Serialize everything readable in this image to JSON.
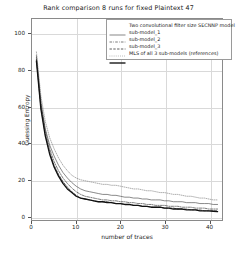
{
  "chart_data": {
    "type": "line",
    "title": "Rank comparison 8 runs for fixed Plaintext 47",
    "xlabel": "number of traces",
    "ylabel": "Guessing Entropy",
    "xlim": [
      0,
      43
    ],
    "ylim": [
      -2,
      108
    ],
    "xticks": [
      0,
      10,
      20,
      30,
      40
    ],
    "yticks": [
      0,
      20,
      40,
      60,
      80,
      100
    ],
    "grid": true,
    "legend_position": "upper right",
    "x": [
      1,
      2,
      3,
      4,
      5,
      6,
      7,
      8,
      9,
      10,
      11,
      12,
      13,
      14,
      15,
      16,
      17,
      18,
      19,
      20,
      21,
      22,
      23,
      24,
      25,
      26,
      27,
      28,
      29,
      30,
      31,
      32,
      33,
      34,
      35,
      36,
      37,
      38,
      39,
      40,
      41,
      42
    ],
    "series": [
      {
        "name": "Two convolutional filter size SECNNP model",
        "style": "solid-thin",
        "color": "#555555",
        "width": 0.7,
        "values": [
          87,
          62,
          48,
          39,
          33,
          28,
          24,
          21,
          18.5,
          16.5,
          15,
          14,
          13.5,
          13,
          12.5,
          12,
          12,
          11.5,
          11.5,
          11,
          10.5,
          10.5,
          10,
          10,
          9.5,
          9.5,
          9,
          9,
          9,
          8.5,
          8.5,
          8,
          8,
          8,
          7.5,
          7.5,
          7.5,
          7,
          7,
          7,
          6.5,
          6.5
        ]
      },
      {
        "name": "sub-model_1",
        "style": "dash-dot",
        "color": "#444444",
        "width": 0.7,
        "values": [
          88,
          63,
          47,
          37,
          30,
          25,
          21,
          18,
          15.5,
          13.5,
          12,
          11,
          10.5,
          10,
          9.5,
          9,
          9,
          8.5,
          8.5,
          8,
          8,
          7.5,
          7.5,
          7,
          7,
          6.5,
          6.5,
          6,
          6,
          6,
          5.5,
          5.5,
          5.5,
          5,
          5,
          5,
          4.5,
          4.5,
          4.5,
          4,
          4,
          4
        ]
      },
      {
        "name": "sub-model_2",
        "style": "dashed",
        "color": "#333333",
        "width": 0.8,
        "values": [
          86,
          60,
          45,
          35,
          28,
          23,
          19,
          16,
          13.5,
          11.5,
          10,
          9.5,
          9,
          8.5,
          8,
          8,
          8,
          7.5,
          7,
          7,
          6.5,
          6.5,
          6,
          6,
          5.5,
          5.5,
          5,
          5,
          5,
          4.5,
          4.5,
          4.5,
          4,
          4,
          4,
          3.5,
          3.5,
          3.5,
          3,
          3,
          3,
          3
        ]
      },
      {
        "name": "sub-model_3",
        "style": "dotted",
        "color": "#8a8a8a",
        "width": 0.7,
        "values": [
          90,
          66,
          52,
          43,
          37,
          32,
          28,
          25,
          22.5,
          21,
          20,
          19.5,
          19,
          18.5,
          18,
          17.5,
          17.5,
          17,
          17,
          16.5,
          16,
          15.5,
          15,
          15,
          14.5,
          14,
          14,
          13.5,
          13,
          13,
          12.5,
          12,
          12,
          11.5,
          11,
          11,
          10.5,
          10,
          10,
          9.5,
          9,
          9
        ]
      },
      {
        "name": "MLS of all 3 sub-models (references)",
        "style": "solid-thick",
        "color": "#111111",
        "width": 1.35,
        "values": [
          85,
          59,
          44,
          34,
          27,
          22,
          18,
          15,
          13,
          11,
          10,
          9.5,
          9,
          8.5,
          8,
          8,
          7.5,
          7.5,
          7,
          7,
          6.5,
          6.5,
          6,
          6,
          5.5,
          5.5,
          5,
          5,
          5,
          4.5,
          4.5,
          4,
          4,
          4,
          3.5,
          3.5,
          3.5,
          3,
          3,
          3,
          2.8,
          2.6
        ]
      }
    ]
  }
}
